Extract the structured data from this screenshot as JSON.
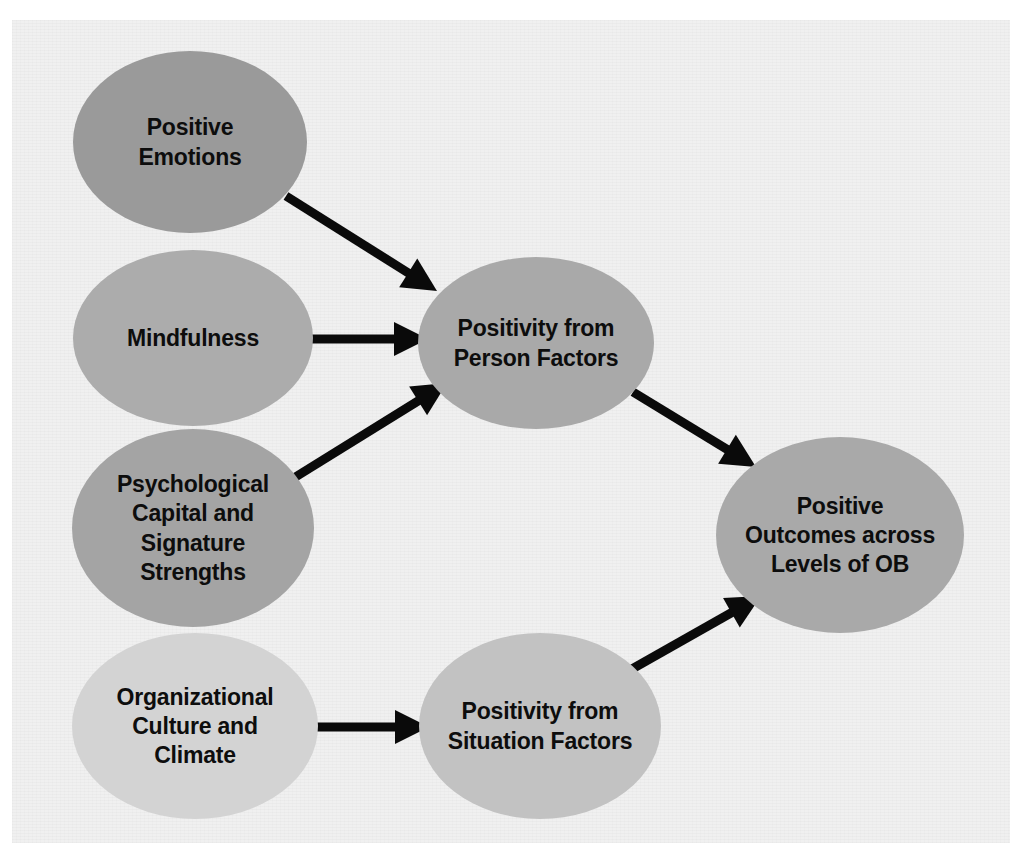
{
  "diagram": {
    "background_color": "#f0f0f0",
    "page_color": "#ffffff",
    "edge_color": "#0a0a0a",
    "text_color": "#0d0d0d",
    "nodes": [
      {
        "id": "positive-emotions",
        "label_lines": [
          "Positive",
          "Emotions"
        ],
        "cx": 190,
        "cy": 142,
        "rx": 117,
        "ry": 91,
        "fill": "#9a9a9a",
        "font_size": 23
      },
      {
        "id": "mindfulness",
        "label_lines": [
          "Mindfulness"
        ],
        "cx": 193,
        "cy": 338,
        "rx": 120,
        "ry": 88,
        "fill": "#acacac",
        "font_size": 23
      },
      {
        "id": "psychological-capital-and-signature-strengths",
        "label_lines": [
          "Psychological",
          "Capital and",
          "Signature",
          "Strengths"
        ],
        "cx": 193,
        "cy": 528,
        "rx": 121,
        "ry": 99,
        "fill": "#a4a4a4",
        "font_size": 23
      },
      {
        "id": "organizational-culture-and-climate",
        "label_lines": [
          "Organizational",
          "Culture and",
          "Climate"
        ],
        "cx": 195,
        "cy": 726,
        "rx": 123,
        "ry": 93,
        "fill": "#d3d3d3",
        "font_size": 23
      },
      {
        "id": "positivity-from-person-factors",
        "label_lines": [
          "Positivity from",
          "Person Factors"
        ],
        "cx": 536,
        "cy": 343,
        "rx": 118,
        "ry": 86,
        "fill": "#a9a9a9",
        "font_size": 23
      },
      {
        "id": "positivity-from-situation-factors",
        "label_lines": [
          "Positivity from",
          "Situation Factors"
        ],
        "cx": 540,
        "cy": 726,
        "rx": 121,
        "ry": 93,
        "fill": "#c2c2c2",
        "font_size": 23
      },
      {
        "id": "positive-outcomes-across-levels-of-ob",
        "label_lines": [
          "Positive",
          "Outcomes across",
          "Levels of OB"
        ],
        "cx": 840,
        "cy": 535,
        "rx": 124,
        "ry": 98,
        "fill": "#a9a9a9",
        "font_size": 23
      }
    ],
    "edges": [
      {
        "id": "edge-positive-emotions-to-person-factors",
        "from": "positive-emotions",
        "to": "positivity-from-person-factors",
        "x1": 286,
        "y1": 196,
        "x2": 437,
        "y2": 291
      },
      {
        "id": "edge-mindfulness-to-person-factors",
        "from": "mindfulness",
        "to": "positivity-from-person-factors",
        "x1": 311,
        "y1": 339,
        "x2": 428,
        "y2": 339
      },
      {
        "id": "edge-psychological-capital-to-person-factors",
        "from": "psychological-capital-and-signature-strengths",
        "to": "positivity-from-person-factors",
        "x1": 289,
        "y1": 481,
        "x2": 447,
        "y2": 383
      },
      {
        "id": "edge-person-factors-to-outcomes",
        "from": "positivity-from-person-factors",
        "to": "positive-outcomes-across-levels-of-ob",
        "x1": 633,
        "y1": 392,
        "x2": 756,
        "y2": 467
      },
      {
        "id": "edge-organizational-culture-to-situation-factors",
        "from": "organizational-culture-and-climate",
        "to": "positivity-from-situation-factors",
        "x1": 312,
        "y1": 727,
        "x2": 429,
        "y2": 727
      },
      {
        "id": "edge-situation-factors-to-outcomes",
        "from": "positivity-from-situation-factors",
        "to": "positive-outcomes-across-levels-of-ob",
        "x1": 632,
        "y1": 669,
        "x2": 761,
        "y2": 596
      }
    ]
  }
}
